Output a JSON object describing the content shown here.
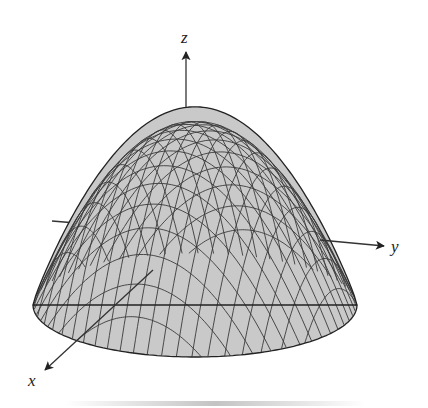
{
  "figure": {
    "surface": {
      "fill_color": "#c9c9c9",
      "mesh_color": "#3a3a3a",
      "outline_color": "#222222"
    },
    "axes": {
      "z": {
        "label": "z"
      },
      "y": {
        "label": "y"
      },
      "x": {
        "label": "x"
      }
    }
  }
}
